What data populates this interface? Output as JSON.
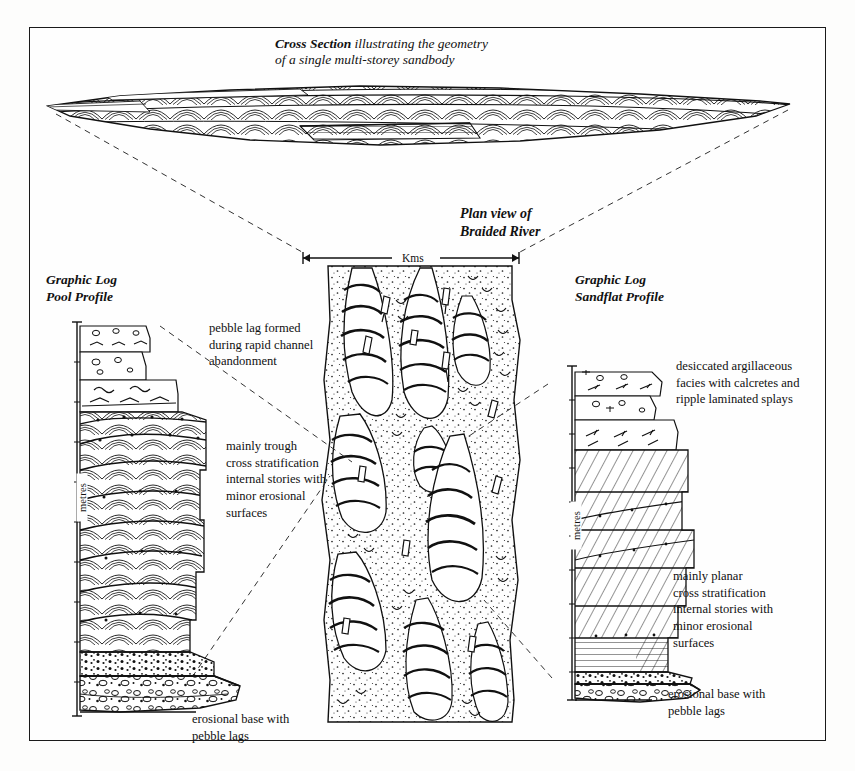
{
  "figure": {
    "kind": "geological-diagram",
    "background_color": "#fefefe",
    "ink_color": "#111111",
    "border_color": "#1a1a1a"
  },
  "cross_section": {
    "title_emphasis": "Cross Section",
    "title_rest": " illustrating the geometry",
    "title_line2": "of a single multi-storey sandbody"
  },
  "plan_view": {
    "title_line1": "Plan view of",
    "title_line2": "Braided River",
    "scale_label": "Kms"
  },
  "left_log": {
    "title_line1": "Graphic Log",
    "title_line2": "Pool Profile",
    "axis_label": "metres",
    "annotations": [
      {
        "name": "pebble-lag",
        "text": "pebble lag formed during rapid channel abandonment"
      },
      {
        "name": "trough-cross-strat",
        "text": "mainly trough cross stratification internal stories with minor erosional surfaces"
      },
      {
        "name": "erosional-base",
        "text": "erosional base with pebble lags"
      }
    ]
  },
  "right_log": {
    "title_line1": "Graphic Log",
    "title_line2": "Sandflat Profile",
    "axis_label": "metres",
    "annotations": [
      {
        "name": "desiccated-argillaceous",
        "text": "desiccated argillaceous facies with calcretes and ripple laminated splays"
      },
      {
        "name": "planar-cross-strat",
        "text": "mainly planar cross stratification internal stories with minor erosional surfaces"
      },
      {
        "name": "erosional-base",
        "text": "erosional base with pebble lags"
      }
    ]
  },
  "annotation_text": {
    "pebble_lag_l1": "pebble lag formed",
    "pebble_lag_l2": "during rapid channel",
    "pebble_lag_l3": "abandonment",
    "trough_l1": "mainly trough",
    "trough_l2": "cross stratification",
    "trough_l3": "internal stories with",
    "trough_l4": "minor erosional",
    "trough_l5": "surfaces",
    "desic_l1": "desiccated argillaceous",
    "desic_l2": "facies with calcretes and",
    "desic_l3": "ripple laminated splays",
    "planar_l1": "mainly planar",
    "planar_l2": "cross stratification",
    "planar_l3": "internal stories with",
    "planar_l4": "minor erosional",
    "planar_l5": "surfaces",
    "eros_r_l1": "erosional base with",
    "eros_r_l2": "pebble lags",
    "eros_l_l1": "erosional base with",
    "eros_l_l2": "pebble lags"
  }
}
